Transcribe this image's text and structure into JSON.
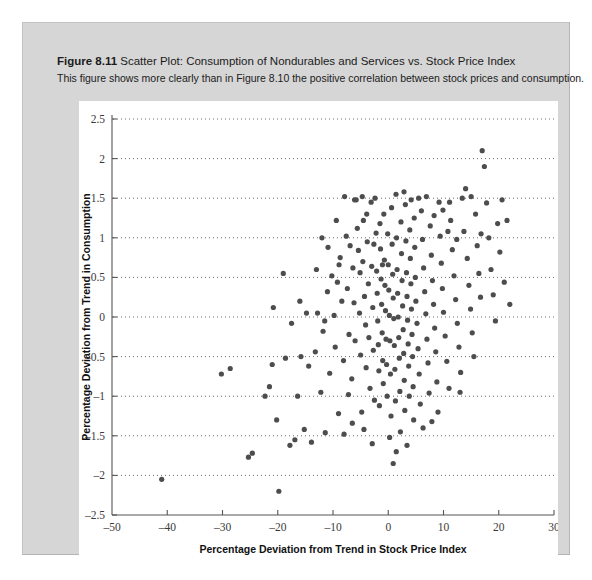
{
  "figure": {
    "number_label": "Figure 8.11",
    "title": "Scatter Plot: Consumption of Nondurables and Services vs. Stock Price Index",
    "subtitle": "This figure shows more clearly than in Figure 8.10 the positive correlation between stock prices and consumption.",
    "panel_color": "#d6d6d6",
    "canvas_color": "#ffffff"
  },
  "chart_data": {
    "type": "scatter",
    "title": "Scatter Plot: Consumption of Nondurables and Services vs. Stock Price Index",
    "xlabel": "Percentage Deviation from Trend in Stock Price Index",
    "ylabel": "Percentage Deviation from Trend in Consumption",
    "xlim": [
      -50,
      30
    ],
    "ylim": [
      -2.5,
      2.5
    ],
    "xticks": [
      -50,
      -40,
      -30,
      -20,
      -10,
      0,
      10,
      20,
      30
    ],
    "xtick_labels": [
      "–50",
      "–40",
      "–30",
      "–20",
      "–10",
      "0",
      "10",
      "20",
      "30"
    ],
    "yticks": [
      -2.5,
      -2,
      -1.5,
      -1,
      -0.5,
      0,
      0.5,
      1,
      1.5,
      2,
      2.5
    ],
    "ytick_labels": [
      "–2.5",
      "–2",
      "–1.5",
      "–1",
      "–0.5",
      "0",
      "0.5",
      "1",
      "1.5",
      "2",
      "2.5"
    ],
    "grid": "horizontal-dotted",
    "legend": null,
    "marker": {
      "shape": "circle",
      "color": "#4d4d4d",
      "radius": 2.6
    },
    "point_count": 232,
    "correlation": "positive",
    "points": [
      [
        -41.0,
        -2.05
      ],
      [
        -30.2,
        -0.72
      ],
      [
        -28.6,
        -0.65
      ],
      [
        -25.3,
        -1.77
      ],
      [
        -24.6,
        -1.72
      ],
      [
        -22.3,
        -1.0
      ],
      [
        -21.5,
        -0.88
      ],
      [
        -21.0,
        -0.6
      ],
      [
        -20.2,
        -1.3
      ],
      [
        -19.8,
        -2.2
      ],
      [
        -18.6,
        -0.52
      ],
      [
        -17.8,
        -1.62
      ],
      [
        -16.9,
        -1.55
      ],
      [
        -16.4,
        -1.0
      ],
      [
        -15.8,
        -0.5
      ],
      [
        -15.2,
        -1.42
      ],
      [
        -14.4,
        -0.62
      ],
      [
        -13.9,
        -1.58
      ],
      [
        -13.2,
        -0.44
      ],
      [
        -12.8,
        0.05
      ],
      [
        -12.2,
        -0.95
      ],
      [
        -11.8,
        -0.18
      ],
      [
        -11.4,
        -1.46
      ],
      [
        -11.0,
        0.32
      ],
      [
        -10.6,
        -0.71
      ],
      [
        -10.2,
        0.52
      ],
      [
        -9.8,
        0.02
      ],
      [
        -9.6,
        -0.38
      ],
      [
        -9.2,
        0.44
      ],
      [
        -9.0,
        -1.22
      ],
      [
        -8.7,
        0.75
      ],
      [
        -8.4,
        0.2
      ],
      [
        -8.1,
        -0.55
      ],
      [
        -7.9,
        1.52
      ],
      [
        -7.6,
        1.02
      ],
      [
        -7.4,
        0.36
      ],
      [
        -7.1,
        -0.22
      ],
      [
        -6.9,
        0.9
      ],
      [
        -6.6,
        -0.78
      ],
      [
        -6.4,
        0.62
      ],
      [
        -6.2,
        0.18
      ],
      [
        -6.0,
        -0.3
      ],
      [
        -5.8,
        1.48
      ],
      [
        -5.6,
        1.12
      ],
      [
        -5.4,
        0.84
      ],
      [
        -5.2,
        0.05
      ],
      [
        -5.0,
        -0.48
      ],
      [
        -4.8,
        -1.2
      ],
      [
        -4.6,
        0.7
      ],
      [
        -4.5,
        1.22
      ],
      [
        -4.3,
        0.26
      ],
      [
        -4.1,
        -0.1
      ],
      [
        -4.0,
        -0.64
      ],
      [
        -3.8,
        0.95
      ],
      [
        -3.6,
        0.42
      ],
      [
        -3.5,
        -0.26
      ],
      [
        -3.3,
        -0.9
      ],
      [
        -3.1,
        1.45
      ],
      [
        -3.0,
        0.64
      ],
      [
        -2.8,
        0.12
      ],
      [
        -2.7,
        -0.42
      ],
      [
        -2.5,
        -1.05
      ],
      [
        -2.4,
        1.5
      ],
      [
        -2.2,
        1.06
      ],
      [
        -2.1,
        0.58
      ],
      [
        -2.0,
        0.3
      ],
      [
        -1.9,
        -0.05
      ],
      [
        -1.8,
        -0.35
      ],
      [
        -1.7,
        -0.68
      ],
      [
        -1.6,
        -1.12
      ],
      [
        -1.5,
        1.18
      ],
      [
        -1.4,
        0.86
      ],
      [
        -1.3,
        0.48
      ],
      [
        -1.2,
        0.16
      ],
      [
        -1.1,
        -0.2
      ],
      [
        -1.0,
        -0.55
      ],
      [
        -0.9,
        -0.84
      ],
      [
        -0.8,
        1.3
      ],
      [
        -0.7,
        0.72
      ],
      [
        -0.6,
        0.4
      ],
      [
        -0.5,
        0.08
      ],
      [
        -0.4,
        -0.28
      ],
      [
        -0.3,
        -0.6
      ],
      [
        -0.2,
        -1.0
      ],
      [
        -0.1,
        1.05
      ],
      [
        0.0,
        0.66
      ],
      [
        0.1,
        0.34
      ],
      [
        0.2,
        0.02
      ],
      [
        0.3,
        -0.3
      ],
      [
        0.4,
        -0.72
      ],
      [
        0.5,
        -1.25
      ],
      [
        0.6,
        1.38
      ],
      [
        0.7,
        0.92
      ],
      [
        0.8,
        0.54
      ],
      [
        0.9,
        0.24
      ],
      [
        1.0,
        -0.02
      ],
      [
        1.1,
        -0.36
      ],
      [
        1.2,
        -0.66
      ],
      [
        1.3,
        -1.06
      ],
      [
        1.4,
        1.55
      ],
      [
        1.5,
        1.0
      ],
      [
        1.6,
        0.6
      ],
      [
        1.7,
        0.3
      ],
      [
        1.8,
        0.0
      ],
      [
        1.9,
        -0.26
      ],
      [
        2.0,
        -0.52
      ],
      [
        2.1,
        -0.94
      ],
      [
        2.2,
        -1.45
      ],
      [
        2.3,
        1.2
      ],
      [
        2.4,
        0.8
      ],
      [
        2.5,
        0.46
      ],
      [
        2.6,
        0.14
      ],
      [
        2.7,
        -0.16
      ],
      [
        2.8,
        -0.46
      ],
      [
        2.9,
        -0.8
      ],
      [
        3.0,
        -1.18
      ],
      [
        3.1,
        1.42
      ],
      [
        3.2,
        0.96
      ],
      [
        3.3,
        0.56
      ],
      [
        3.4,
        0.26
      ],
      [
        3.5,
        -0.04
      ],
      [
        3.6,
        -0.34
      ],
      [
        3.7,
        -0.62
      ],
      [
        3.8,
        -1.0
      ],
      [
        3.9,
        1.1
      ],
      [
        4.0,
        0.74
      ],
      [
        4.1,
        0.42
      ],
      [
        4.2,
        0.1
      ],
      [
        4.3,
        -0.22
      ],
      [
        4.4,
        -0.5
      ],
      [
        4.5,
        -0.88
      ],
      [
        4.6,
        -1.3
      ],
      [
        4.7,
        1.25
      ],
      [
        4.8,
        0.88
      ],
      [
        4.9,
        0.5
      ],
      [
        5.0,
        0.2
      ],
      [
        5.2,
        -0.08
      ],
      [
        5.4,
        -0.4
      ],
      [
        5.6,
        -0.72
      ],
      [
        5.8,
        -1.1
      ],
      [
        6.0,
        1.34
      ],
      [
        6.2,
        0.98
      ],
      [
        6.4,
        0.62
      ],
      [
        6.6,
        0.32
      ],
      [
        6.8,
        0.04
      ],
      [
        7.0,
        -0.28
      ],
      [
        7.2,
        -0.58
      ],
      [
        7.4,
        -0.96
      ],
      [
        7.6,
        1.15
      ],
      [
        7.8,
        0.78
      ],
      [
        8.0,
        0.46
      ],
      [
        8.2,
        0.16
      ],
      [
        8.4,
        -0.14
      ],
      [
        8.6,
        -0.44
      ],
      [
        8.8,
        -0.82
      ],
      [
        9.0,
        -1.2
      ],
      [
        9.2,
        1.45
      ],
      [
        9.4,
        1.02
      ],
      [
        9.6,
        0.68
      ],
      [
        9.8,
        0.36
      ],
      [
        10.0,
        0.06
      ],
      [
        10.3,
        -0.24
      ],
      [
        10.6,
        -0.56
      ],
      [
        11.0,
        -0.9
      ],
      [
        11.3,
        1.22
      ],
      [
        11.6,
        0.85
      ],
      [
        11.9,
        0.52
      ],
      [
        12.2,
        0.22
      ],
      [
        12.5,
        -0.08
      ],
      [
        12.8,
        -0.38
      ],
      [
        13.1,
        -0.7
      ],
      [
        13.4,
        1.5
      ],
      [
        13.7,
        1.08
      ],
      [
        14.0,
        1.62
      ],
      [
        14.3,
        0.74
      ],
      [
        14.6,
        0.4
      ],
      [
        14.9,
        0.1
      ],
      [
        15.2,
        -0.2
      ],
      [
        15.5,
        -0.5
      ],
      [
        15.8,
        1.3
      ],
      [
        16.1,
        0.9
      ],
      [
        16.4,
        0.55
      ],
      [
        16.7,
        0.25
      ],
      [
        17.0,
        2.1
      ],
      [
        17.4,
        1.9
      ],
      [
        17.8,
        1.44
      ],
      [
        18.2,
        1.0
      ],
      [
        18.6,
        0.6
      ],
      [
        19.0,
        0.28
      ],
      [
        19.4,
        -0.05
      ],
      [
        19.8,
        1.18
      ],
      [
        20.2,
        0.82
      ],
      [
        20.6,
        1.48
      ],
      [
        21.0,
        0.44
      ],
      [
        21.5,
        1.22
      ],
      [
        22.0,
        0.16
      ],
      [
        -8.0,
        -1.48
      ],
      [
        -6.5,
        -1.34
      ],
      [
        -5.1,
        0.56
      ],
      [
        -3.9,
        1.3
      ],
      [
        -2.6,
        0.92
      ],
      [
        -1.05,
        0.66
      ],
      [
        0.25,
        -1.52
      ],
      [
        1.45,
        -1.7
      ],
      [
        2.85,
        1.58
      ],
      [
        4.15,
        1.48
      ],
      [
        5.5,
        1.5
      ],
      [
        6.9,
        1.52
      ],
      [
        8.3,
        1.28
      ],
      [
        9.9,
        1.35
      ],
      [
        11.1,
        1.45
      ],
      [
        12.4,
        0.98
      ],
      [
        -7.2,
        -0.98
      ],
      [
        -4.4,
        -1.42
      ],
      [
        -13.0,
        0.6
      ],
      [
        -10.9,
        0.88
      ],
      [
        -16.0,
        0.2
      ],
      [
        -19.0,
        0.55
      ],
      [
        -12.0,
        1.0
      ],
      [
        -9.4,
        1.22
      ],
      [
        0.9,
        -1.85
      ],
      [
        3.4,
        -1.62
      ],
      [
        -2.9,
        -1.6
      ],
      [
        6.3,
        -1.4
      ],
      [
        -11.5,
        -0.05
      ],
      [
        -14.8,
        0.05
      ],
      [
        -17.5,
        -0.08
      ],
      [
        -20.8,
        0.12
      ],
      [
        15.0,
        1.52
      ],
      [
        16.8,
        1.05
      ],
      [
        13.0,
        -0.95
      ],
      [
        7.9,
        -1.32
      ],
      [
        -6.1,
        1.48
      ],
      [
        -4.7,
        1.52
      ],
      [
        10.8,
        1.08
      ],
      [
        -8.9,
        0.66
      ]
    ]
  }
}
